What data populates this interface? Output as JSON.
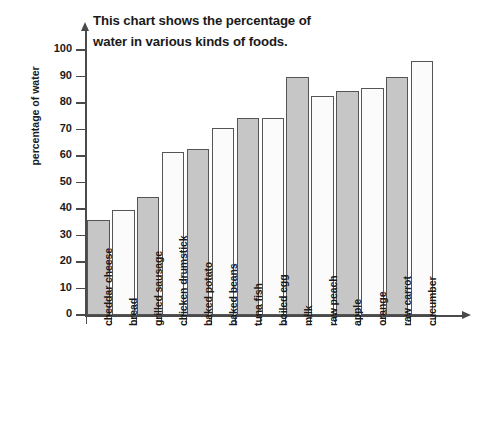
{
  "chart_data": {
    "type": "bar",
    "title": "This chart shows the percentage of water in various kinds of foods.",
    "xlabel": "",
    "ylabel": "percentage of water",
    "ylim": [
      0,
      100
    ],
    "ytick_labels": [
      "0",
      "10",
      "20",
      "30",
      "40",
      "50",
      "60",
      "70",
      "80",
      "90",
      "100"
    ],
    "ytick_values": [
      0,
      10,
      20,
      30,
      40,
      50,
      60,
      70,
      80,
      90,
      100
    ],
    "grid": false,
    "legend": "none",
    "categories": [
      "cheddar cheese",
      "bread",
      "grilled sausage",
      "chicken drumstick",
      "baked potato",
      "baked beans",
      "tuna fish",
      "boiled egg",
      "milk",
      "raw peach",
      "apple",
      "orange",
      "raw carrot",
      "cucumber"
    ],
    "values": [
      36,
      39.5,
      44.5,
      61.5,
      62.5,
      70.5,
      74.5,
      74.5,
      90,
      82.5,
      84.5,
      85.5,
      90,
      96
    ],
    "bar_fills": [
      "gray",
      "white",
      "gray",
      "white",
      "gray",
      "white",
      "gray",
      "white",
      "gray",
      "white",
      "gray",
      "white",
      "gray",
      "white"
    ],
    "colors": {
      "bar_gray": "#c6c6c6",
      "bar_white": "#fbfbfb",
      "bar_outline": "#555555",
      "axis": "#4a4a4a",
      "text": "#1a1a1a"
    }
  }
}
